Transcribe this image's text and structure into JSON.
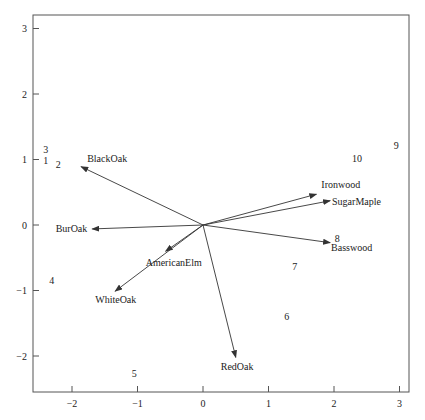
{
  "chart_data": {
    "type": "scatter",
    "subtype": "biplot",
    "title": "",
    "xlabel": "",
    "ylabel": "",
    "xlim": [
      -2.6,
      3.15
    ],
    "ylim": [
      -2.55,
      3.2
    ],
    "grid": false,
    "legend": null,
    "x_ticks": [
      -2,
      -1,
      0,
      1,
      2,
      3
    ],
    "y_ticks": [
      -2,
      -1,
      0,
      1,
      2,
      3
    ],
    "observations": [
      {
        "label": "1",
        "x": -2.4,
        "y": 0.98
      },
      {
        "label": "2",
        "x": -2.21,
        "y": 0.92
      },
      {
        "label": "3",
        "x": -2.4,
        "y": 1.15
      },
      {
        "label": "4",
        "x": -2.31,
        "y": -0.85
      },
      {
        "label": "5",
        "x": -1.05,
        "y": -2.26
      },
      {
        "label": "6",
        "x": 1.28,
        "y": -1.39
      },
      {
        "label": "7",
        "x": 1.4,
        "y": -0.64
      },
      {
        "label": "8",
        "x": 2.05,
        "y": -0.2
      },
      {
        "label": "9",
        "x": 2.95,
        "y": 1.21
      },
      {
        "label": "10",
        "x": 2.35,
        "y": 1.01
      }
    ],
    "variables": [
      {
        "name": "BlackOak",
        "x": -1.86,
        "y": 0.89,
        "label_dx": 6,
        "label_dy": -5,
        "anchor": "start"
      },
      {
        "name": "BurOak",
        "x": -1.69,
        "y": -0.06,
        "label_dx": -5,
        "label_dy": 3,
        "anchor": "end"
      },
      {
        "name": "AmericanElm",
        "x": -0.57,
        "y": -0.4,
        "label_dx": -20,
        "label_dy": 15,
        "anchor": "start"
      },
      {
        "name": "WhiteOak",
        "x": -1.34,
        "y": -1.01,
        "label_dx": -20,
        "label_dy": 12,
        "anchor": "start"
      },
      {
        "name": "RedOak",
        "x": 0.5,
        "y": -2.02,
        "label_dx": -15,
        "label_dy": 13,
        "anchor": "start"
      },
      {
        "name": "Ironwood",
        "x": 1.73,
        "y": 0.47,
        "label_dx": 5,
        "label_dy": -6,
        "anchor": "start"
      },
      {
        "name": "SugarMaple",
        "x": 1.94,
        "y": 0.37,
        "label_dx": 2,
        "label_dy": 4,
        "anchor": "start"
      },
      {
        "name": "Basswood",
        "x": 1.94,
        "y": -0.27,
        "label_dx": 1,
        "label_dy": 8,
        "anchor": "start"
      }
    ]
  },
  "colors": {
    "axis": "#555555",
    "arrow": "#333333",
    "text": "#222222"
  }
}
